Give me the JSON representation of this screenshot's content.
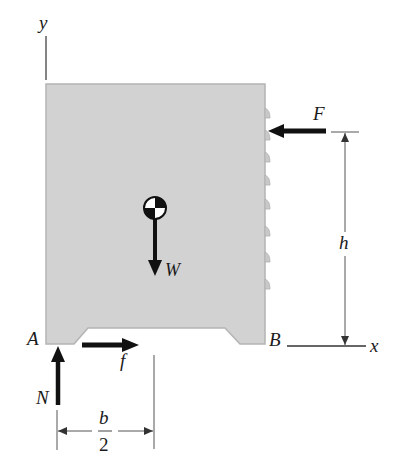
{
  "figure": {
    "type": "free-body diagram",
    "colors": {
      "body_fill": "#d2d2d2",
      "body_edge": "#b4b4b4",
      "force_arrow": "#111111",
      "dimension_line": "#444444",
      "background": "#ffffff"
    },
    "axes": {
      "y_label": "y",
      "x_label": "x"
    },
    "points": {
      "A": "A",
      "B": "B"
    },
    "forces": {
      "F": "F",
      "W": "W",
      "N": "N",
      "f": "f"
    },
    "dimensions": {
      "height": "h",
      "half_width_numerator": "b",
      "half_width_denominator": "2"
    },
    "symbols": {
      "center_of_gravity": "center-of-gravity-symbol"
    }
  }
}
